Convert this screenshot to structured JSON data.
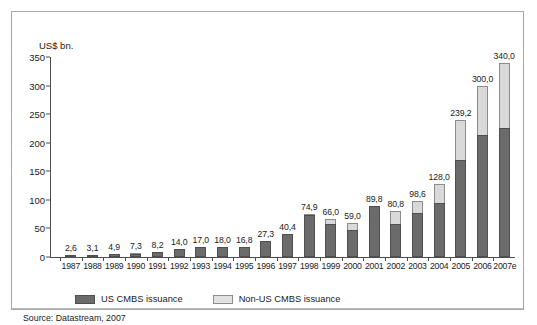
{
  "chart_data": {
    "type": "bar",
    "stacked": true,
    "title": "",
    "subtitle": "",
    "xlabel": "",
    "ylabel": "US$ bn.",
    "ylim": [
      0,
      350
    ],
    "ytick_labels": [
      "0",
      "50",
      "100",
      "150",
      "200",
      "250",
      "300",
      "350"
    ],
    "ytick_values": [
      0,
      50,
      100,
      150,
      200,
      250,
      300,
      350
    ],
    "grid": false,
    "legend_position": "bottom-left",
    "categories": [
      "1987",
      "1988",
      "1989",
      "1990",
      "1991",
      "1992",
      "1993",
      "1994",
      "1995",
      "1996",
      "1997",
      "1998",
      "1999",
      "2000",
      "2001",
      "2002",
      "2003",
      "2004",
      "2005",
      "2006",
      "2007e"
    ],
    "series": [
      {
        "name": "US CMBS issuance",
        "color": "#6b6b6b",
        "values": [
          2.6,
          3.1,
          4.9,
          5.3,
          8.2,
          14.0,
          17.0,
          18.0,
          16.8,
          27.3,
          40.4,
          74.4,
          58.0,
          47.0,
          89.8,
          57.0,
          77.8,
          95.0,
          170.0,
          213.0,
          225.0
        ]
      },
      {
        "name": "Non-US CMBS issuance",
        "color": "#d9d9d9",
        "values": [
          0.0,
          0.0,
          0.0,
          2.0,
          0.0,
          0.0,
          0.0,
          0.0,
          0.0,
          0.0,
          0.0,
          0.5,
          8.0,
          12.0,
          0.0,
          23.8,
          20.8,
          33.0,
          69.2,
          87.0,
          115.0
        ]
      }
    ],
    "totals": [
      2.6,
      3.1,
      4.9,
      7.3,
      8.2,
      14.0,
      17.0,
      18.0,
      16.8,
      27.3,
      40.4,
      74.9,
      66.0,
      59.0,
      89.8,
      80.8,
      98.6,
      128.0,
      239.2,
      300.0,
      340.0
    ],
    "data_labels": [
      "2,6",
      "3,1",
      "4,9",
      "7,3",
      "8,2",
      "14,0",
      "17,0",
      "18,0",
      "16,8",
      "27,3",
      "40,4",
      "74,9",
      "66,0",
      "59,0",
      "89,8",
      "80,8",
      "98,6",
      "128,0",
      "239,2",
      "300,0",
      "340,0"
    ],
    "source": "Source: Datastream, 2007"
  },
  "legend": {
    "items": [
      {
        "label": "US CMBS issuance",
        "color": "#6b6b6b"
      },
      {
        "label": "Non-US CMBS issuance",
        "color": "#d9d9d9"
      }
    ]
  },
  "axis": {
    "y_title": "US$ bn."
  },
  "footer": {
    "source": "Source: Datastream, 2007"
  }
}
